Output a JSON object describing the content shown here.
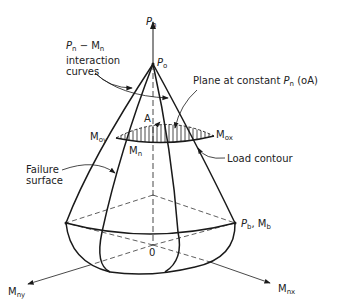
{
  "diagram": {
    "axes": {
      "vertical": {
        "symbol": "P",
        "sub": "n"
      },
      "x_axis": {
        "symbol": "M",
        "sub": "nx"
      },
      "y_axis": {
        "symbol": "M",
        "sub": "ny"
      },
      "origin": "0"
    },
    "points": {
      "apex": {
        "symbol": "P",
        "sub": "o"
      },
      "balanced": {
        "text": "P",
        "sub1": "b",
        "sep": ", M",
        "sub2": "b"
      },
      "point_A": "A",
      "mox": {
        "symbol": "M",
        "sub": "ox"
      },
      "moy": {
        "symbol": "M",
        "sub": "oy"
      },
      "mn": {
        "symbol": "M",
        "sub": "n"
      }
    },
    "annotations": {
      "interaction_curves": {
        "line1_a": "P",
        "line1_a_sub": "n",
        "line1_mid": " − M",
        "line1_b_sub": "n",
        "line2": "interaction",
        "line3": "curves"
      },
      "plane": {
        "prefix": "Plane at constant ",
        "sym": "P",
        "sub": "n",
        "suffix": " (oA)"
      },
      "load_contour": "Load contour",
      "failure_surface": {
        "line1": "Failure",
        "line2": "surface"
      }
    },
    "colors": {
      "line": "#1a1a1a",
      "text": "#222222",
      "background": "#ffffff"
    }
  }
}
